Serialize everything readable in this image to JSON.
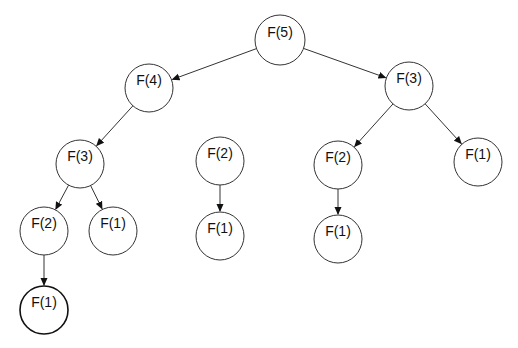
{
  "diagram": {
    "type": "tree",
    "title": "",
    "colors": {
      "stroke": "#333333",
      "text": "#111111",
      "background": "#ffffff"
    },
    "nodes": [
      {
        "id": "n5",
        "label": "F(5)",
        "cx": 280,
        "cy": 40,
        "r": 25
      },
      {
        "id": "n4",
        "label": "F(4)",
        "cx": 149,
        "cy": 88,
        "r": 24
      },
      {
        "id": "n3r",
        "label": "F(3)",
        "cx": 409,
        "cy": 86,
        "r": 24
      },
      {
        "id": "n3l",
        "label": "F(3)",
        "cx": 80,
        "cy": 164,
        "r": 24
      },
      {
        "id": "n2m",
        "label": "F(2)",
        "cx": 220,
        "cy": 161,
        "r": 24
      },
      {
        "id": "n2r",
        "label": "F(2)",
        "cx": 338,
        "cy": 165,
        "r": 24
      },
      {
        "id": "n1r",
        "label": "F(1)",
        "cx": 478,
        "cy": 162,
        "r": 24
      },
      {
        "id": "n2l",
        "label": "F(2)",
        "cx": 44,
        "cy": 231,
        "r": 24
      },
      {
        "id": "n1l",
        "label": "F(1)",
        "cx": 113,
        "cy": 231,
        "r": 24
      },
      {
        "id": "n1m",
        "label": "F(1)",
        "cx": 220,
        "cy": 236,
        "r": 24
      },
      {
        "id": "n1rb",
        "label": "F(1)",
        "cx": 338,
        "cy": 239,
        "r": 24
      },
      {
        "id": "n1ll",
        "label": "F(1)",
        "cx": 44,
        "cy": 310,
        "r": 24,
        "bold": true
      }
    ],
    "edges": [
      {
        "from": "n5",
        "to": "n4"
      },
      {
        "from": "n5",
        "to": "n3r"
      },
      {
        "from": "n4",
        "to": "n3l"
      },
      {
        "from": "n3r",
        "to": "n2r"
      },
      {
        "from": "n3r",
        "to": "n1r"
      },
      {
        "from": "n3l",
        "to": "n2l"
      },
      {
        "from": "n3l",
        "to": "n1l"
      },
      {
        "from": "n2m",
        "to": "n1m"
      },
      {
        "from": "n2r",
        "to": "n1rb"
      },
      {
        "from": "n2l",
        "to": "n1ll"
      }
    ]
  }
}
